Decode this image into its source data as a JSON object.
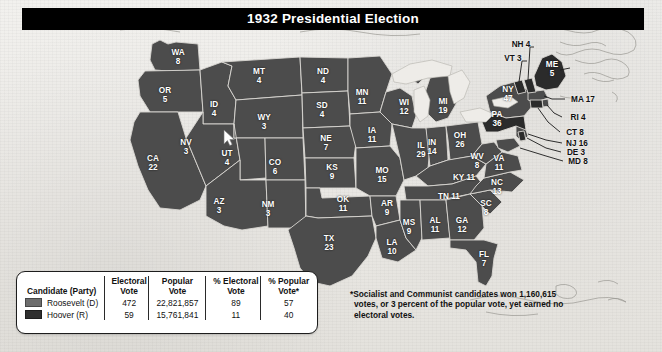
{
  "title": "1932 Presidential Election",
  "legend": {
    "headers": {
      "candidate": "Candidate (Party)",
      "electoral_vote": "Electoral Vote",
      "popular_vote": "Popular Vote",
      "pct_electoral": "% Electoral Vote",
      "pct_popular": "% Popular Vote*"
    },
    "rows": [
      {
        "candidate": "Roosevelt (D)",
        "swatch_color": "#6d6d6d",
        "electoral_vote": "472",
        "popular_vote": "22,821,857",
        "pct_electoral": "89",
        "pct_popular": "57"
      },
      {
        "candidate": "Hoover (R)",
        "swatch_color": "#2f2f2f",
        "electoral_vote": "59",
        "popular_vote": "15,761,841",
        "pct_electoral": "11",
        "pct_popular": "40"
      }
    ]
  },
  "footnote": "*Socialist and Communist candidates won 1,160,615 votes, or 3 percent of the popular vote, yet earned no electoral votes.",
  "chart_data": {
    "type": "map",
    "title": "1932 Presidential Election",
    "measure": "Electoral votes by state",
    "legend_position": "bottom-left",
    "series": [
      {
        "name": "Roosevelt (D)",
        "color": "#4c4c4c",
        "electoral_total": 472,
        "popular_total": 22821857,
        "pct_electoral": 89,
        "pct_popular": 57
      },
      {
        "name": "Hoover (R)",
        "color": "#2b2b2b",
        "electoral_total": 59,
        "popular_total": 15761841,
        "pct_electoral": 11,
        "pct_popular": 40
      }
    ],
    "states": [
      {
        "code": "WA",
        "ev": 8,
        "winner": "Roosevelt (D)"
      },
      {
        "code": "OR",
        "ev": 5,
        "winner": "Roosevelt (D)"
      },
      {
        "code": "CA",
        "ev": 22,
        "winner": "Roosevelt (D)"
      },
      {
        "code": "ID",
        "ev": 4,
        "winner": "Roosevelt (D)"
      },
      {
        "code": "NV",
        "ev": 3,
        "winner": "Roosevelt (D)"
      },
      {
        "code": "MT",
        "ev": 4,
        "winner": "Roosevelt (D)"
      },
      {
        "code": "WY",
        "ev": 3,
        "winner": "Roosevelt (D)"
      },
      {
        "code": "UT",
        "ev": 4,
        "winner": "Roosevelt (D)"
      },
      {
        "code": "CO",
        "ev": 6,
        "winner": "Roosevelt (D)"
      },
      {
        "code": "AZ",
        "ev": 3,
        "winner": "Roosevelt (D)"
      },
      {
        "code": "NM",
        "ev": 3,
        "winner": "Roosevelt (D)"
      },
      {
        "code": "ND",
        "ev": 4,
        "winner": "Roosevelt (D)"
      },
      {
        "code": "SD",
        "ev": 4,
        "winner": "Roosevelt (D)"
      },
      {
        "code": "NE",
        "ev": 7,
        "winner": "Roosevelt (D)"
      },
      {
        "code": "KS",
        "ev": 9,
        "winner": "Roosevelt (D)"
      },
      {
        "code": "OK",
        "ev": 11,
        "winner": "Roosevelt (D)"
      },
      {
        "code": "TX",
        "ev": 23,
        "winner": "Roosevelt (D)"
      },
      {
        "code": "MN",
        "ev": 11,
        "winner": "Roosevelt (D)"
      },
      {
        "code": "IA",
        "ev": 11,
        "winner": "Roosevelt (D)"
      },
      {
        "code": "MO",
        "ev": 15,
        "winner": "Roosevelt (D)"
      },
      {
        "code": "AR",
        "ev": 9,
        "winner": "Roosevelt (D)"
      },
      {
        "code": "LA",
        "ev": 10,
        "winner": "Roosevelt (D)"
      },
      {
        "code": "WI",
        "ev": 12,
        "winner": "Roosevelt (D)"
      },
      {
        "code": "IL",
        "ev": 29,
        "winner": "Roosevelt (D)"
      },
      {
        "code": "MI",
        "ev": 19,
        "winner": "Roosevelt (D)"
      },
      {
        "code": "IN",
        "ev": 14,
        "winner": "Roosevelt (D)"
      },
      {
        "code": "OH",
        "ev": 26,
        "winner": "Roosevelt (D)"
      },
      {
        "code": "KY",
        "ev": 11,
        "winner": "Roosevelt (D)"
      },
      {
        "code": "TN",
        "ev": 11,
        "winner": "Roosevelt (D)"
      },
      {
        "code": "MS",
        "ev": 9,
        "winner": "Roosevelt (D)"
      },
      {
        "code": "AL",
        "ev": 11,
        "winner": "Roosevelt (D)"
      },
      {
        "code": "GA",
        "ev": 12,
        "winner": "Roosevelt (D)"
      },
      {
        "code": "FL",
        "ev": 7,
        "winner": "Roosevelt (D)"
      },
      {
        "code": "SC",
        "ev": 8,
        "winner": "Roosevelt (D)"
      },
      {
        "code": "NC",
        "ev": 13,
        "winner": "Roosevelt (D)"
      },
      {
        "code": "VA",
        "ev": 11,
        "winner": "Roosevelt (D)"
      },
      {
        "code": "WV",
        "ev": 8,
        "winner": "Roosevelt (D)"
      },
      {
        "code": "MD",
        "ev": 8,
        "winner": "Roosevelt (D)"
      },
      {
        "code": "DE",
        "ev": 3,
        "winner": "Hoover (R)"
      },
      {
        "code": "NJ",
        "ev": 16,
        "winner": "Roosevelt (D)"
      },
      {
        "code": "PA",
        "ev": 36,
        "winner": "Hoover (R)"
      },
      {
        "code": "NY",
        "ev": 47,
        "winner": "Roosevelt (D)"
      },
      {
        "code": "CT",
        "ev": 8,
        "winner": "Hoover (R)"
      },
      {
        "code": "RI",
        "ev": 4,
        "winner": "Roosevelt (D)"
      },
      {
        "code": "MA",
        "ev": 17,
        "winner": "Roosevelt (D)"
      },
      {
        "code": "VT",
        "ev": 3,
        "winner": "Hoover (R)"
      },
      {
        "code": "NH",
        "ev": 4,
        "winner": "Hoover (R)"
      },
      {
        "code": "ME",
        "ev": 5,
        "winner": "Hoover (R)"
      }
    ]
  },
  "map_labels": {
    "inner": [
      {
        "name": "WA",
        "ev": "8",
        "x": 178,
        "y": 57
      },
      {
        "name": "OR",
        "ev": "5",
        "x": 165,
        "y": 95
      },
      {
        "name": "CA",
        "ev": "22",
        "x": 153,
        "y": 163
      },
      {
        "name": "ID",
        "ev": "4",
        "x": 214,
        "y": 109
      },
      {
        "name": "NV",
        "ev": "3",
        "x": 186,
        "y": 147
      },
      {
        "name": "MT",
        "ev": "4",
        "x": 259,
        "y": 76
      },
      {
        "name": "WY",
        "ev": "3",
        "x": 264,
        "y": 122
      },
      {
        "name": "UT",
        "ev": "4",
        "x": 227,
        "y": 158
      },
      {
        "name": "CO",
        "ev": "6",
        "x": 275,
        "y": 167
      },
      {
        "name": "AZ",
        "ev": "3",
        "x": 219,
        "y": 206
      },
      {
        "name": "NM",
        "ev": "3",
        "x": 268,
        "y": 209
      },
      {
        "name": "ND",
        "ev": "4",
        "x": 323,
        "y": 76
      },
      {
        "name": "SD",
        "ev": "4",
        "x": 322,
        "y": 110
      },
      {
        "name": "NE",
        "ev": "7",
        "x": 326,
        "y": 143
      },
      {
        "name": "KS",
        "ev": "9",
        "x": 332,
        "y": 172
      },
      {
        "name": "OK",
        "ev": "11",
        "x": 343,
        "y": 204
      },
      {
        "name": "TX",
        "ev": "23",
        "x": 329,
        "y": 243
      },
      {
        "name": "MN",
        "ev": "11",
        "x": 362,
        "y": 97
      },
      {
        "name": "IA",
        "ev": "11",
        "x": 372,
        "y": 135
      },
      {
        "name": "MO",
        "ev": "15",
        "x": 382,
        "y": 175
      },
      {
        "name": "AR",
        "ev": "9",
        "x": 387,
        "y": 208
      },
      {
        "name": "LA",
        "ev": "10",
        "x": 392,
        "y": 247
      },
      {
        "name": "WI",
        "ev": "12",
        "x": 404,
        "y": 107
      },
      {
        "name": "IL",
        "ev": "29",
        "x": 421,
        "y": 150
      },
      {
        "name": "MI",
        "ev": "19",
        "x": 443,
        "y": 106
      },
      {
        "name": "IN",
        "ev": "14",
        "x": 432,
        "y": 147
      },
      {
        "name": "OH",
        "ev": "26",
        "x": 460,
        "y": 140
      },
      {
        "name": "MS",
        "ev": "9",
        "x": 409,
        "y": 227
      },
      {
        "name": "AL",
        "ev": "11",
        "x": 435,
        "y": 225
      },
      {
        "name": "GA",
        "ev": "12",
        "x": 462,
        "y": 225
      },
      {
        "name": "FL",
        "ev": "7",
        "x": 484,
        "y": 259
      },
      {
        "name": "SC",
        "ev": "8",
        "x": 486,
        "y": 208
      },
      {
        "name": "NC",
        "ev": "13",
        "x": 497,
        "y": 187
      },
      {
        "name": "VA",
        "ev": "11",
        "x": 499,
        "y": 163
      },
      {
        "name": "WV",
        "ev": "8",
        "x": 477,
        "y": 161
      },
      {
        "name": "PA",
        "ev": "36",
        "x": 497,
        "y": 119
      },
      {
        "name": "NY",
        "ev": "47",
        "x": 508,
        "y": 94
      },
      {
        "name": "ME",
        "ev": "5",
        "x": 552,
        "y": 69
      }
    ],
    "inner_inline": [
      {
        "text": "KY 11",
        "x": 464,
        "y": 177
      },
      {
        "text": "TN 11",
        "x": 449,
        "y": 196
      }
    ],
    "outer": [
      {
        "text": "NH 4",
        "x": 521,
        "y": 44
      },
      {
        "text": "VT 3",
        "x": 513,
        "y": 58
      },
      {
        "text": "MA 17",
        "x": 583,
        "y": 99
      },
      {
        "text": "RI 4",
        "x": 578,
        "y": 117
      },
      {
        "text": "CT 8",
        "x": 575,
        "y": 132
      },
      {
        "text": "NJ 16",
        "x": 577,
        "y": 143
      },
      {
        "text": "DE 3",
        "x": 576,
        "y": 152
      },
      {
        "text": "MD 8",
        "x": 578,
        "y": 161
      }
    ]
  }
}
